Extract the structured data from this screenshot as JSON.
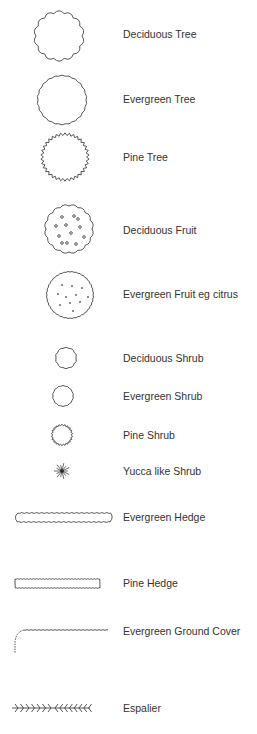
{
  "legend": {
    "items": [
      {
        "symbol": "deciduous-tree-icon",
        "label": "Deciduous Tree"
      },
      {
        "symbol": "evergreen-tree-icon",
        "label": "Evergreen Tree"
      },
      {
        "symbol": "pine-tree-icon",
        "label": "Pine Tree"
      },
      {
        "symbol": "deciduous-fruit-icon",
        "label": "Deciduous Fruit"
      },
      {
        "symbol": "evergreen-fruit-icon",
        "label": "Evergreen Fruit eg citrus"
      },
      {
        "symbol": "deciduous-shrub-icon",
        "label": "Deciduous Shrub"
      },
      {
        "symbol": "evergreen-shrub-icon",
        "label": "Evergreen Shrub"
      },
      {
        "symbol": "pine-shrub-icon",
        "label": "Pine Shrub"
      },
      {
        "symbol": "yucca-shrub-icon",
        "label": "Yucca like Shrub"
      },
      {
        "symbol": "evergreen-hedge-icon",
        "label": "Evergreen Hedge"
      },
      {
        "symbol": "pine-hedge-icon",
        "label": "Pine Hedge"
      },
      {
        "symbol": "ground-cover-icon",
        "label": "Evergreen Ground Cover"
      },
      {
        "symbol": "espalier-icon",
        "label": "Espalier"
      }
    ]
  },
  "colors": {
    "line": "#444444",
    "text": "#333333",
    "background": "#ffffff"
  }
}
